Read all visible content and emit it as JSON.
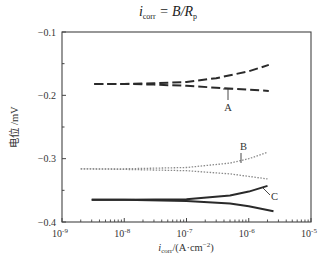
{
  "chart_data": {
    "type": "line",
    "title_parts": {
      "i": "i",
      "sub": "corr",
      "eq": " = B/R",
      "p": "p"
    },
    "xlabel": "i_corr/(A·cm⁻²)",
    "xlabel_parts": {
      "i": "i",
      "sub": "corr",
      "rest": "/(A·cm",
      "sup": "−2",
      "close": ")"
    },
    "ylabel": "电位 /mV",
    "xscale": "log",
    "xlim": [
      1e-09,
      1e-05
    ],
    "ylim": [
      -0.4,
      -0.1
    ],
    "x_ticks": [
      {
        "exp": -9,
        "label": "10",
        "sup": "-9"
      },
      {
        "exp": -8,
        "label": "10",
        "sup": "-8"
      },
      {
        "exp": -7,
        "label": "10",
        "sup": "-7"
      },
      {
        "exp": -6,
        "label": "10",
        "sup": "-6"
      },
      {
        "exp": -5,
        "label": "10",
        "sup": "-5"
      }
    ],
    "y_ticks": [
      {
        "value": -0.1,
        "label": "−0.1"
      },
      {
        "value": -0.2,
        "label": "−0.2"
      },
      {
        "value": -0.3,
        "label": "−0.3"
      },
      {
        "value": -0.4,
        "label": "−0.4"
      }
    ],
    "y_minor_ticks": [
      -0.15,
      -0.25,
      -0.35
    ],
    "grid": false,
    "legend": "none",
    "series": [
      {
        "name": "A",
        "style": "dashed",
        "color": "#2a2a2a",
        "branches": [
          {
            "x": [
              3.3e-09,
              1e-08,
              3e-08,
              1e-07,
              3e-07,
              1e-06,
              2.1e-06
            ],
            "y": [
              -0.182,
              -0.182,
              -0.181,
              -0.179,
              -0.173,
              -0.162,
              -0.152
            ]
          },
          {
            "x": [
              3.3e-09,
              1e-08,
              3e-08,
              1e-07,
              3e-07,
              1e-06,
              2.1e-06
            ],
            "y": [
              -0.182,
              -0.182,
              -0.183,
              -0.185,
              -0.188,
              -0.191,
              -0.193
            ]
          }
        ],
        "label": {
          "text": "A",
          "x": 228,
          "y": 111,
          "leader": [
            228,
            89,
            228,
            100
          ],
          "leader_cap": [
            223,
            89,
            233,
            89
          ]
        }
      },
      {
        "name": "B",
        "style": "dotted",
        "color": "#8a8a8a",
        "branches": [
          {
            "x": [
              2e-09,
              1e-08,
              1e-07,
              5e-07,
              1e-06,
              2e-06
            ],
            "y": [
              -0.316,
              -0.316,
              -0.314,
              -0.307,
              -0.3,
              -0.29
            ]
          },
          {
            "x": [
              2e-09,
              1e-08,
              1e-07,
              5e-07,
              1e-06,
              2e-06
            ],
            "y": [
              -0.316,
              -0.317,
              -0.319,
              -0.324,
              -0.328,
              -0.332
            ]
          }
        ],
        "label": {
          "text": "B",
          "x": 240,
          "y": 150,
          "leader": [
            241,
            153,
            241,
            163
          ]
        }
      },
      {
        "name": "C",
        "style": "solid",
        "color": "#2a2a2a",
        "branches": [
          {
            "x": [
              3e-09,
              1e-08,
              1e-07,
              5e-07,
              1e-06,
              2e-06
            ],
            "y": [
              -0.365,
              -0.365,
              -0.364,
              -0.358,
              -0.352,
              -0.343
            ]
          },
          {
            "x": [
              3e-09,
              1e-08,
              1e-07,
              5e-07,
              1e-06,
              2.5e-06
            ],
            "y": [
              -0.365,
              -0.365,
              -0.367,
              -0.371,
              -0.375,
              -0.383
            ]
          }
        ],
        "label": {
          "text": "C",
          "x": 271,
          "y": 200,
          "leader": [
            263,
            188,
            270,
            195
          ]
        }
      }
    ],
    "caption_faint": ""
  },
  "layout": {
    "plot": {
      "left": 62,
      "top": 32,
      "right": 311,
      "bottom": 222
    },
    "axis_color": "#444444",
    "background": "#ffffff"
  }
}
